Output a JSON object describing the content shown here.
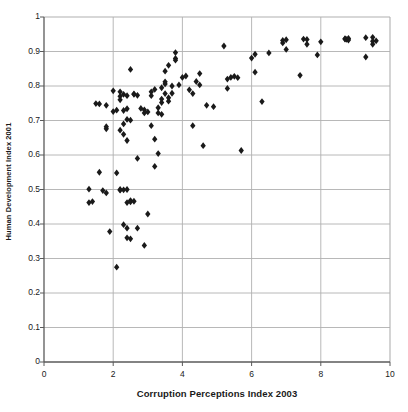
{
  "chart_data": {
    "type": "scatter",
    "title": "",
    "xlabel": "Corruption Perceptions Index 2003",
    "ylabel": "Human Development Index 2001",
    "xlim": [
      0,
      10
    ],
    "ylim": [
      0,
      1
    ],
    "xticks": [
      0,
      2,
      4,
      6,
      8,
      10
    ],
    "xtick_labels": [
      "0",
      "2",
      "4",
      "6",
      "8",
      "10"
    ],
    "yticks": [
      0,
      0.1,
      0.2,
      0.3,
      0.4,
      0.5,
      0.6,
      0.7,
      0.8,
      0.9,
      1
    ],
    "ytick_labels": [
      "0",
      "0.1",
      "0.2",
      "0.3",
      "0.4",
      "0.5",
      "0.6",
      "0.7",
      "0.8",
      "0.9",
      "1"
    ],
    "grid": {
      "horizontal": true,
      "vertical": true,
      "color": "#b0b0b0"
    },
    "legend": null,
    "marker": {
      "shape": "diamond",
      "color": "#1a1a1a",
      "size": 3.4
    },
    "points": [
      [
        1.3,
        0.501
      ],
      [
        1.3,
        0.462
      ],
      [
        1.4,
        0.465
      ],
      [
        1.5,
        0.749
      ],
      [
        1.6,
        0.748
      ],
      [
        1.6,
        0.55
      ],
      [
        1.7,
        0.497
      ],
      [
        1.8,
        0.744
      ],
      [
        1.8,
        0.676
      ],
      [
        1.8,
        0.682
      ],
      [
        1.8,
        0.49
      ],
      [
        1.9,
        0.378
      ],
      [
        2.0,
        0.786
      ],
      [
        2.0,
        0.726
      ],
      [
        2.1,
        0.73
      ],
      [
        2.1,
        0.548
      ],
      [
        2.1,
        0.275
      ],
      [
        2.2,
        0.783
      ],
      [
        2.2,
        0.77
      ],
      [
        2.2,
        0.76
      ],
      [
        2.2,
        0.672
      ],
      [
        2.2,
        0.5
      ],
      [
        2.2,
        0.498
      ],
      [
        2.3,
        0.776
      ],
      [
        2.3,
        0.729
      ],
      [
        2.3,
        0.69
      ],
      [
        2.3,
        0.66
      ],
      [
        2.3,
        0.499
      ],
      [
        2.3,
        0.398
      ],
      [
        2.4,
        0.772
      ],
      [
        2.4,
        0.734
      ],
      [
        2.4,
        0.703
      ],
      [
        2.4,
        0.642
      ],
      [
        2.4,
        0.5
      ],
      [
        2.4,
        0.462
      ],
      [
        2.4,
        0.388
      ],
      [
        2.4,
        0.36
      ],
      [
        2.5,
        0.848
      ],
      [
        2.5,
        0.701
      ],
      [
        2.5,
        0.468
      ],
      [
        2.5,
        0.464
      ],
      [
        2.5,
        0.357
      ],
      [
        2.6,
        0.777
      ],
      [
        2.6,
        0.776
      ],
      [
        2.6,
        0.466
      ],
      [
        2.7,
        0.773
      ],
      [
        2.7,
        0.388
      ],
      [
        2.7,
        0.59
      ],
      [
        2.8,
        0.735
      ],
      [
        2.9,
        0.731
      ],
      [
        2.9,
        0.722
      ],
      [
        2.9,
        0.338
      ],
      [
        3.0,
        0.725
      ],
      [
        3.0,
        0.429
      ],
      [
        3.1,
        0.783
      ],
      [
        3.1,
        0.772
      ],
      [
        3.1,
        0.685
      ],
      [
        3.2,
        0.79
      ],
      [
        3.2,
        0.646
      ],
      [
        3.2,
        0.567
      ],
      [
        3.3,
        0.737
      ],
      [
        3.3,
        0.722
      ],
      [
        3.3,
        0.604
      ],
      [
        3.4,
        0.795
      ],
      [
        3.4,
        0.762
      ],
      [
        3.4,
        0.752
      ],
      [
        3.4,
        0.718
      ],
      [
        3.5,
        0.843
      ],
      [
        3.5,
        0.812
      ],
      [
        3.5,
        0.806
      ],
      [
        3.5,
        0.778
      ],
      [
        3.6,
        0.86
      ],
      [
        3.6,
        0.766
      ],
      [
        3.6,
        0.756
      ],
      [
        3.7,
        0.8
      ],
      [
        3.7,
        0.779
      ],
      [
        3.8,
        0.897
      ],
      [
        3.8,
        0.88
      ],
      [
        3.8,
        0.875
      ],
      [
        3.9,
        0.803
      ],
      [
        4.0,
        0.825
      ],
      [
        4.1,
        0.829
      ],
      [
        4.2,
        0.789
      ],
      [
        4.3,
        0.685
      ],
      [
        4.3,
        0.778
      ],
      [
        4.4,
        0.813
      ],
      [
        4.5,
        0.836
      ],
      [
        4.5,
        0.803
      ],
      [
        4.6,
        0.627
      ],
      [
        4.7,
        0.744
      ],
      [
        4.9,
        0.74
      ],
      [
        5.2,
        0.916
      ],
      [
        5.3,
        0.82
      ],
      [
        5.3,
        0.793
      ],
      [
        5.4,
        0.825
      ],
      [
        5.5,
        0.828
      ],
      [
        5.6,
        0.824
      ],
      [
        5.7,
        0.613
      ],
      [
        6.0,
        0.881
      ],
      [
        6.1,
        0.892
      ],
      [
        6.1,
        0.84
      ],
      [
        6.3,
        0.755
      ],
      [
        6.5,
        0.896
      ],
      [
        6.9,
        0.932
      ],
      [
        6.9,
        0.925
      ],
      [
        7.0,
        0.934
      ],
      [
        7.0,
        0.906
      ],
      [
        7.4,
        0.831
      ],
      [
        7.5,
        0.936
      ],
      [
        7.6,
        0.935
      ],
      [
        7.6,
        0.921
      ],
      [
        7.9,
        0.89
      ],
      [
        8.0,
        0.928
      ],
      [
        8.7,
        0.936
      ],
      [
        8.7,
        0.937
      ],
      [
        8.75,
        0.935
      ],
      [
        8.8,
        0.938
      ],
      [
        8.8,
        0.933
      ],
      [
        9.3,
        0.94
      ],
      [
        9.3,
        0.884
      ],
      [
        9.5,
        0.941
      ],
      [
        9.5,
        0.921
      ],
      [
        9.5,
        0.93
      ],
      [
        9.6,
        0.931
      ]
    ]
  },
  "axes": {
    "x_title": "Corruption Perceptions Index 2003",
    "y_title": "Human Development Index 2001"
  }
}
